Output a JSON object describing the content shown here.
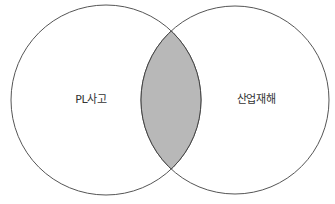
{
  "diagram": {
    "type": "venn",
    "sets": [
      {
        "label": "PL사고"
      },
      {
        "label": "산업재해"
      }
    ],
    "intersection": {
      "highlighted": true
    },
    "colors": {
      "background": "#ffffff",
      "stroke": "#555555",
      "intersection_fill": "#b8b8b8"
    }
  }
}
